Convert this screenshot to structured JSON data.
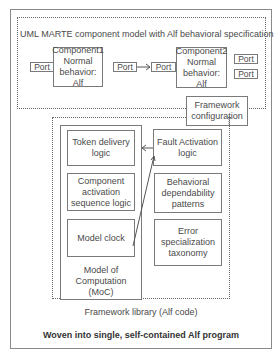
{
  "diagram": {
    "model_box": {
      "title": "UML MARTE component model with Alf behavioral specification"
    },
    "components": [
      {
        "name": "Component1",
        "line2": "Normal",
        "line3": "behavior: Alf"
      },
      {
        "name": "Component2",
        "line2": "Normal",
        "line3": "behavior: Alf"
      }
    ],
    "ports": {
      "c1_left": "Port",
      "c1_right": "Port",
      "c2_left": "Port",
      "c2_right_top": "Port",
      "c2_right_bottom": "Port"
    },
    "framework_config": {
      "line1": "Framework",
      "line2": "configuration"
    },
    "library": {
      "label": "Framework library (Alf code)",
      "moc": {
        "line1": "Model of",
        "line2": "Computation",
        "line3": "(MoC)",
        "items": [
          {
            "line1": "Token delivery",
            "line2": "logic"
          },
          {
            "line1": "Component",
            "line2": "activation",
            "line3": "sequence logic"
          },
          {
            "line1": "Model clock"
          }
        ]
      },
      "right_items": [
        {
          "line1": "Fault Activation",
          "line2": "logic"
        },
        {
          "line1": "Behavioral",
          "line2": "dependability",
          "line3": "patterns"
        },
        {
          "line1": "Error",
          "line2": "specialization",
          "line3": "taxonomy"
        }
      ]
    },
    "footer": "Woven into single, self-contained Alf program"
  }
}
